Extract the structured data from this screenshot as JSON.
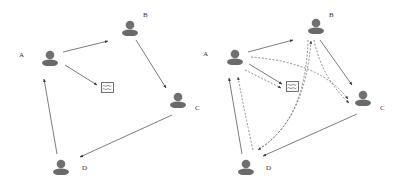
{
  "colors": {
    "person": "#6e6e6e",
    "arrow": "#444444",
    "dashed": "#555555",
    "message_stroke": "#555555"
  },
  "diagrams": [
    {
      "id": "left",
      "nodes": [
        {
          "id": "A",
          "label": "A",
          "x": 50,
          "y": 58,
          "label_x": 19,
          "label_y": 52
        },
        {
          "id": "B",
          "label": "B",
          "x": 130,
          "y": 28,
          "label_x": 143,
          "label_y": 12
        },
        {
          "id": "C",
          "label": "C",
          "x": 178,
          "y": 100,
          "label_x": 195,
          "label_y": 105
        },
        {
          "id": "D",
          "label": "D",
          "x": 61,
          "y": 166,
          "label_x": 82,
          "label_y": 165
        }
      ],
      "message": {
        "x": 107,
        "y": 87
      },
      "solid_edges": [
        [
          "A",
          "B"
        ],
        [
          "B",
          "C"
        ],
        [
          "C",
          "D"
        ],
        [
          "D",
          "A"
        ],
        [
          "A",
          "message"
        ]
      ],
      "dashed_edges": []
    },
    {
      "id": "right",
      "nodes": [
        {
          "id": "A",
          "label": "A",
          "x": 235,
          "y": 57,
          "label_x": 203,
          "label_y": 51
        },
        {
          "id": "B",
          "label": "B",
          "x": 316,
          "y": 26,
          "label_x": 329,
          "label_y": 12
        },
        {
          "id": "C",
          "label": "C",
          "x": 363,
          "y": 98,
          "label_x": 380,
          "label_y": 105
        },
        {
          "id": "D",
          "label": "D",
          "x": 246,
          "y": 166,
          "label_x": 266,
          "label_y": 165
        }
      ],
      "message": {
        "x": 292,
        "y": 86
      },
      "solid_edges": [
        [
          "A",
          "B"
        ],
        [
          "B",
          "C"
        ],
        [
          "C",
          "D"
        ],
        [
          "D",
          "A"
        ],
        [
          "A",
          "message"
        ]
      ],
      "dashed_edges": [
        [
          "A",
          "message"
        ],
        [
          "A",
          "C"
        ],
        [
          "B",
          "C"
        ],
        [
          "D",
          "B"
        ],
        [
          "B",
          "D"
        ],
        [
          "D",
          "A"
        ]
      ]
    }
  ]
}
